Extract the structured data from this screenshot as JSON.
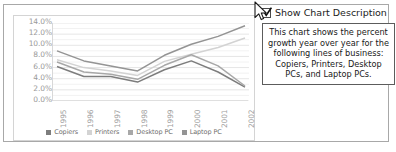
{
  "chart_data": {
    "type": "line",
    "title": "",
    "xlabel": "",
    "ylabel": "",
    "ylim": [
      0,
      14
    ],
    "ytick_labels": [
      "14.0%",
      "12.0%",
      "10.0%",
      "8.0%",
      "6.0%",
      "4.0%",
      "2.0%",
      "0.0%"
    ],
    "ytick_values": [
      14,
      12,
      10,
      8,
      6,
      4,
      2,
      0
    ],
    "grid": true,
    "legend_position": "bottom",
    "categories": [
      "1995",
      "1996",
      "1997",
      "1998",
      "1999",
      "2000",
      "2001",
      "2002"
    ],
    "series": [
      {
        "name": "Copiers",
        "color": "#7d7d7d",
        "values": [
          6.2,
          4.4,
          4.4,
          3.4,
          5.6,
          7.2,
          5.2,
          2.5
        ]
      },
      {
        "name": "Printers",
        "color": "#d3d3d3",
        "values": [
          7.4,
          6.0,
          5.4,
          4.6,
          7.1,
          8.4,
          9.6,
          11.3
        ]
      },
      {
        "name": "Desktop PC",
        "color": "#a8a8a8",
        "values": [
          7.0,
          5.2,
          4.8,
          3.9,
          6.4,
          8.3,
          6.3,
          2.7
        ]
      },
      {
        "name": "Laptop PC",
        "color": "#949494",
        "values": [
          9.0,
          7.2,
          6.3,
          5.4,
          8.2,
          10.2,
          11.6,
          13.5
        ]
      }
    ]
  },
  "panel": {
    "checkbox": {
      "label": "Show Chart Description",
      "checked": true
    },
    "description": "This chart shows the percent growth year over year for the following lines of business: Copiers, Printers, Desktop PCs, and Laptop PCs."
  }
}
